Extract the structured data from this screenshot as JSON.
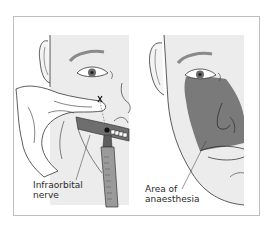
{
  "figure": {
    "panels": [
      {
        "id": "left",
        "description": "Infraorbital nerve block injection via intraoral approach",
        "label_lines": [
          "Infraorbital",
          "nerve"
        ]
      },
      {
        "id": "right",
        "description": "Resulting area of anaesthesia on face",
        "label_lines": [
          "Area of",
          "anaesthesia"
        ]
      }
    ],
    "colors": {
      "skin": "#ececec",
      "anaesthesia_area": "#7a7a7a",
      "line": "#333333",
      "frame": "#bdbdbd",
      "syringe": "#9a9a9a"
    }
  }
}
